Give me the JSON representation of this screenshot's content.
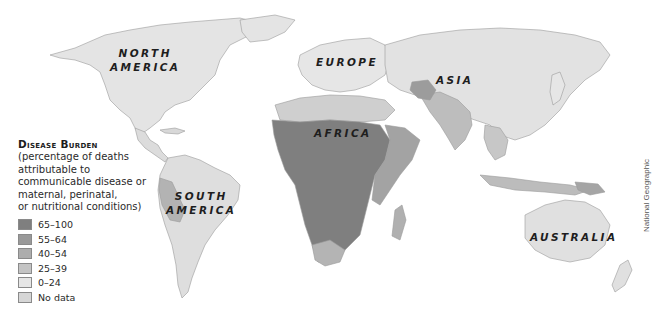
{
  "map": {
    "regions": [
      {
        "id": "north-america",
        "label_lines": [
          "NORTH",
          "AMERICA"
        ]
      },
      {
        "id": "europe",
        "label_lines": [
          "EUROPE"
        ]
      },
      {
        "id": "asia",
        "label_lines": [
          "ASIA"
        ]
      },
      {
        "id": "africa",
        "label_lines": [
          "AFRICA"
        ]
      },
      {
        "id": "south-america",
        "label_lines": [
          "SOUTH",
          "AMERICA"
        ]
      },
      {
        "id": "australia",
        "label_lines": [
          "AUSTRALIA"
        ]
      }
    ]
  },
  "legend": {
    "title": "Disease Burden",
    "description": "(percentage of deaths\nattributable to\ncommunicable disease or\nmaternal, perinatal,\nor nutritional conditions)",
    "items": [
      {
        "label": "65–100",
        "color": "#7f7f7f"
      },
      {
        "label": "55–64",
        "color": "#999999"
      },
      {
        "label": "40–54",
        "color": "#adadad"
      },
      {
        "label": "25–39",
        "color": "#c4c4c4"
      },
      {
        "label": "0–24",
        "color": "#e6e6e6"
      },
      {
        "label": "No data",
        "color": "#d6d6d6"
      }
    ]
  },
  "credit": "National Geographic"
}
